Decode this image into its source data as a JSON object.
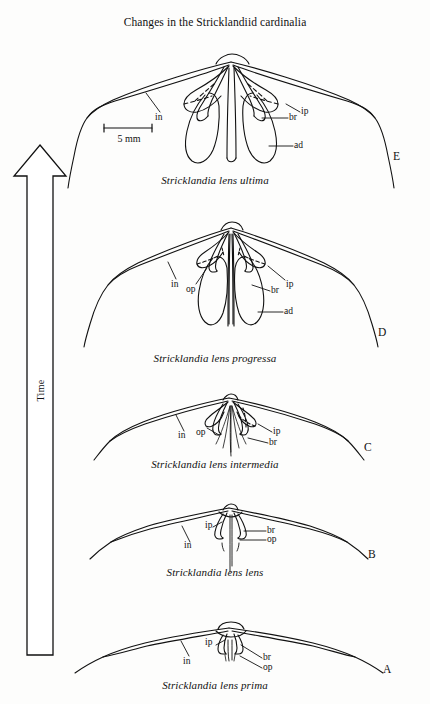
{
  "figure": {
    "title": "Changes in the Stricklandiid cardinalia",
    "axis_arrow_label": "Time",
    "scale_bar_label": "5 mm",
    "background_color": "#fdfdfc",
    "ink_color": "#111111"
  },
  "specimens": [
    {
      "panel_letter": "E",
      "caption": "Stricklandia lens ultima",
      "labels": [
        {
          "key": "in",
          "text": "in"
        },
        {
          "key": "ip",
          "text": "ip"
        },
        {
          "key": "br",
          "text": "br"
        },
        {
          "key": "ad",
          "text": "ad"
        }
      ]
    },
    {
      "panel_letter": "D",
      "caption": "Stricklandia lens progressa",
      "labels": [
        {
          "key": "in",
          "text": "in"
        },
        {
          "key": "op",
          "text": "op"
        },
        {
          "key": "ip",
          "text": "ip"
        },
        {
          "key": "br",
          "text": "br"
        },
        {
          "key": "ad",
          "text": "ad"
        }
      ]
    },
    {
      "panel_letter": "C",
      "caption": "Stricklandia lens intermedia",
      "labels": [
        {
          "key": "in",
          "text": "in"
        },
        {
          "key": "op",
          "text": "op"
        },
        {
          "key": "ip",
          "text": "ip"
        },
        {
          "key": "br",
          "text": "br"
        }
      ]
    },
    {
      "panel_letter": "B",
      "caption": "Stricklandia lens lens",
      "labels": [
        {
          "key": "ip",
          "text": "ip"
        },
        {
          "key": "in",
          "text": "in"
        },
        {
          "key": "br",
          "text": "br"
        },
        {
          "key": "op",
          "text": "op"
        }
      ]
    },
    {
      "panel_letter": "A",
      "caption": "Stricklandia lens prima",
      "labels": [
        {
          "key": "ip",
          "text": "ip"
        },
        {
          "key": "in",
          "text": "in"
        },
        {
          "key": "br",
          "text": "br"
        },
        {
          "key": "op",
          "text": "op"
        }
      ]
    }
  ],
  "bottom_cropped_caption": ""
}
